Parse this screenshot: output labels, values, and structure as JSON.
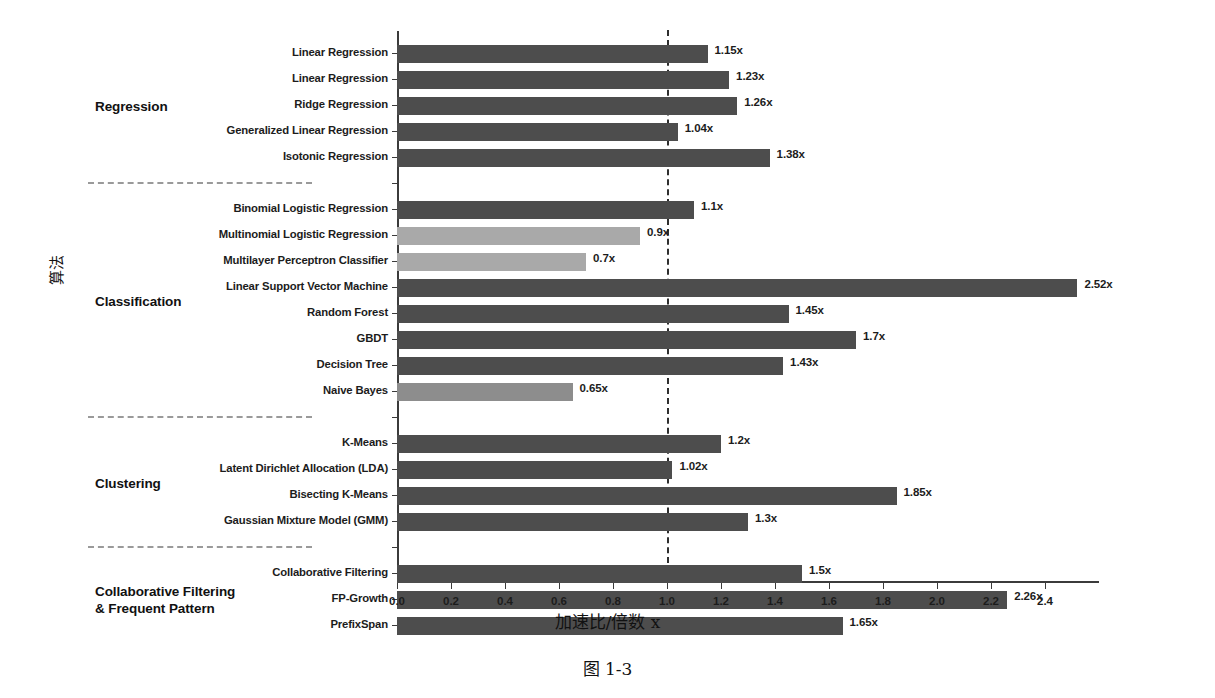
{
  "figure": {
    "caption": "图 1-3",
    "x_axis_title": "加速比/倍数 x",
    "y_axis_title": "算法"
  },
  "chart_data": {
    "type": "bar",
    "orientation": "horizontal",
    "title": "",
    "xlabel": "加速比/倍数 x",
    "ylabel": "算法",
    "xlim": [
      0.0,
      2.6
    ],
    "grid": false,
    "legend": "none",
    "reference_line": {
      "value": 1.0,
      "style": "dashed",
      "color": "#2e2e2e"
    },
    "value_label_suffix": "x",
    "categories": [
      "Linear Regression",
      "Linear Regression",
      "Ridge Regression",
      "Generalized Linear Regression",
      "Isotonic Regression",
      "Binomial Logistic Regression",
      "Multinomial Logistic Regression",
      "Multilayer Perceptron Classifier",
      "Linear Support Vector Machine",
      "Random Forest",
      "GBDT",
      "Decision Tree",
      "Naive Bayes",
      "K-Means",
      "Latent Dirichlet Allocation (LDA)",
      "Bisecting K-Means",
      "Gaussian Mixture Model (GMM)",
      "Collaborative Filtering",
      "FP-Growth",
      "PrefixSpan"
    ],
    "values": [
      1.15,
      1.23,
      1.26,
      1.04,
      1.38,
      1.1,
      0.9,
      0.7,
      2.52,
      1.45,
      1.7,
      1.43,
      0.65,
      1.2,
      1.02,
      1.85,
      1.3,
      1.5,
      2.26,
      1.65
    ],
    "value_labels": [
      "1.15x",
      "1.23x",
      "1.26x",
      "1.04x",
      "1.38x",
      "1.1x",
      "0.9x",
      "0.7x",
      "2.52x",
      "1.45x",
      "1.7x",
      "1.43x",
      "0.65x",
      "1.2x",
      "1.02x",
      "1.85x",
      "1.3x",
      "1.5x",
      "2.26x",
      "1.65x"
    ],
    "bar_shades": [
      "dark",
      "dark",
      "dark",
      "dark",
      "dark",
      "dark",
      "light",
      "light",
      "dark",
      "dark",
      "dark",
      "dark",
      "mid",
      "dark",
      "dark",
      "dark",
      "dark",
      "dark",
      "dark",
      "dark"
    ],
    "xticks": [
      0.0,
      0.2,
      0.4,
      0.6,
      0.8,
      1.0,
      1.2,
      1.4,
      1.6,
      1.8,
      2.0,
      2.2,
      2.4
    ],
    "xtick_labels": [
      "0.0",
      "0.2",
      "0.4",
      "0.6",
      "0.8",
      "1.0",
      "1.2",
      "1.4",
      "1.6",
      "1.8",
      "2.0",
      "2.2",
      "2.4"
    ],
    "groups": [
      {
        "label": "Regression",
        "members": 5
      },
      {
        "label": "Classification",
        "members": 8
      },
      {
        "label": "Clustering",
        "members": 4
      },
      {
        "label": "Collaborative Filtering\n& Frequent Pattern",
        "members": 3
      }
    ],
    "colors": {
      "dark": "#4d4d4d",
      "mid": "#8d8d8d",
      "light": "#a9a9a9",
      "axis": "#3b3b3b",
      "separator": "#9a9a9a"
    }
  }
}
